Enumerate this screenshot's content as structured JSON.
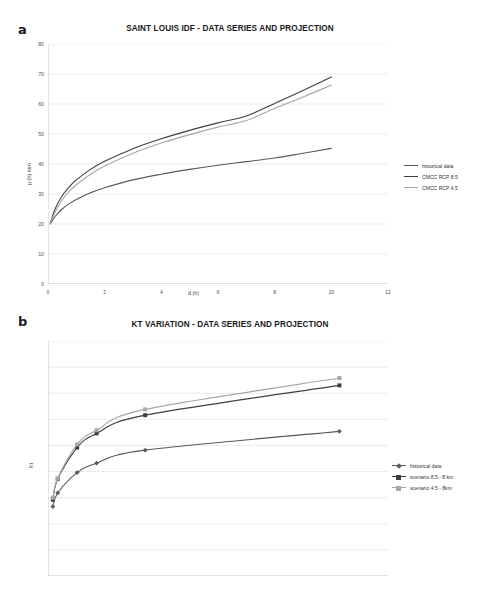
{
  "figure": {
    "background": "#ffffff",
    "panels": [
      {
        "letter": "a",
        "title": "SAINT LOUIS IDF - DATA SERIES AND PROJECTION"
      },
      {
        "letter": "b",
        "title": "KT VARIATION - DATA SERIES AND PROJECTION"
      }
    ]
  },
  "colors": {
    "historical": "#595959",
    "rcp85": "#3f3f3f",
    "rcp45": "#a6a6a6",
    "grid": "#e2e2e2",
    "axis": "#bfbfbf",
    "text": "#555555"
  },
  "chart_data": [
    {
      "type": "line",
      "title": "SAINT LOUIS IDF - DATA SERIES AND PROJECTION",
      "panel": "a",
      "xlabel": "d  (h)",
      "ylabel": "μ (h)   mm",
      "xlim": [
        0,
        12
      ],
      "ylim": [
        0,
        80
      ],
      "xticks": [
        0,
        2,
        4,
        6,
        8,
        10,
        12
      ],
      "yticks": [
        0,
        10,
        20,
        30,
        40,
        50,
        60,
        70,
        80
      ],
      "grid": "horizontal",
      "legend_position": "right",
      "x": [
        0.08,
        0.25,
        0.5,
        0.75,
        1,
        1.5,
        2,
        3,
        4,
        5,
        6,
        7,
        8,
        9,
        10
      ],
      "series": [
        {
          "name": "historical data",
          "color": "#595959",
          "values": [
            20.0,
            22.5,
            25.0,
            26.8,
            28.2,
            30.4,
            32.1,
            34.7,
            36.6,
            38.2,
            39.6,
            40.8,
            42.0,
            43.6,
            45.2
          ]
        },
        {
          "name": "CMCC RCP 8.5",
          "color": "#3f3f3f",
          "values": [
            20.3,
            25.0,
            29.4,
            32.4,
            34.7,
            38.2,
            40.9,
            45.1,
            48.4,
            51.2,
            53.7,
            56.0,
            60.2,
            64.5,
            69.0
          ]
        },
        {
          "name": "CMCC RCP 4.5",
          "color": "#a6a6a6",
          "values": [
            20.1,
            23.9,
            28.0,
            30.9,
            33.1,
            36.6,
            39.3,
            43.6,
            47.0,
            49.8,
            52.3,
            54.5,
            58.5,
            62.3,
            66.3
          ]
        }
      ]
    },
    {
      "type": "line",
      "title": "KT VARIATION - DATA SERIES AND PROJECTION",
      "panel": "b",
      "xlabel": "",
      "ylabel": "Kt",
      "xlim": [
        0,
        350
      ],
      "ylim": [
        0,
        4.5
      ],
      "xticks": [
        0,
        50,
        100,
        150,
        200,
        250,
        300,
        350
      ],
      "yticks": [
        0,
        0.5,
        1,
        1.5,
        2,
        2.5,
        3,
        3.5,
        4,
        4.5
      ],
      "grid": "horizontal",
      "legend_position": "right",
      "x": [
        5,
        10,
        30,
        50,
        100,
        300
      ],
      "series": [
        {
          "name": "historical data",
          "color": "#595959",
          "marker": "diamond",
          "values": [
            1.33,
            1.59,
            1.98,
            2.16,
            2.41,
            2.77
          ]
        },
        {
          "name": "scenario 8.5 - 8 km",
          "color": "#3f3f3f",
          "marker": "square",
          "values": [
            1.46,
            1.86,
            2.46,
            2.73,
            3.08,
            3.65
          ]
        },
        {
          "name": "scenario 4.5 - 8km",
          "color": "#a6a6a6",
          "marker": "square",
          "values": [
            1.5,
            1.87,
            2.52,
            2.79,
            3.19,
            3.79
          ]
        }
      ]
    }
  ]
}
